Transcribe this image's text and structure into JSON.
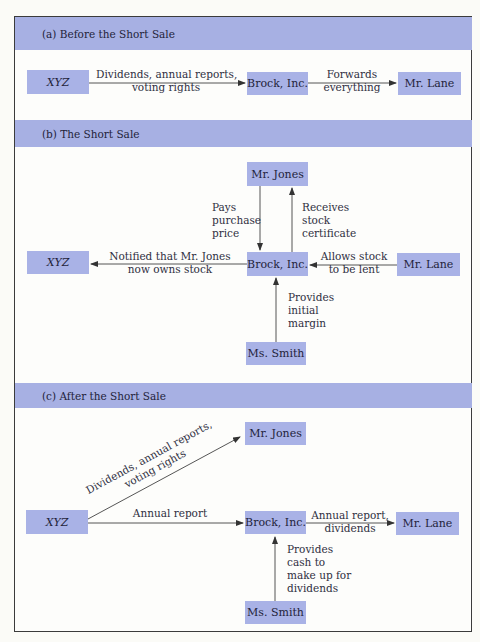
{
  "diagram": {
    "sections": [
      {
        "id": "a",
        "title": "(a) Before the Short Sale",
        "nodes": {
          "xyz": "XYZ",
          "brock": "Brock, Inc.",
          "lane": "Mr. Lane"
        },
        "edges": {
          "xyz_to_brock": {
            "line1": "Dividends, annual reports,",
            "line2": "voting rights"
          },
          "brock_to_lane": {
            "line1": "Forwards",
            "line2": "everything"
          }
        }
      },
      {
        "id": "b",
        "title": "(b) The Short Sale",
        "nodes": {
          "jones": "Mr. Jones",
          "xyz": "XYZ",
          "brock": "Brock, Inc.",
          "lane": "Mr. Lane",
          "smith": "Ms. Smith"
        },
        "edges": {
          "jones_to_brock": {
            "line1": "Pays",
            "line2": "purchase",
            "line3": "price"
          },
          "brock_to_jones": {
            "line1": "Receives",
            "line2": "stock",
            "line3": "certificate"
          },
          "brock_to_xyz": {
            "line1": "Notified that Mr. Jones",
            "line2": "now owns stock"
          },
          "lane_to_brock": {
            "line1": "Allows stock",
            "line2": "to be lent"
          },
          "smith_to_brock": {
            "line1": "Provides",
            "line2": "initial",
            "line3": "margin"
          }
        }
      },
      {
        "id": "c",
        "title": "(c) After the Short Sale",
        "nodes": {
          "jones": "Mr. Jones",
          "xyz": "XYZ",
          "brock": "Brock, Inc.",
          "lane": "Mr. Lane",
          "smith": "Ms. Smith"
        },
        "edges": {
          "xyz_to_jones": {
            "line1": "Dividends, annual reports,",
            "line2": "voting rights"
          },
          "xyz_to_brock": {
            "line1": "Annual report"
          },
          "brock_to_lane": {
            "line1": "Annual report,",
            "line2": "dividends"
          },
          "smith_to_brock": {
            "line1": "Provides",
            "line2": "cash to",
            "line3": "make up for",
            "line4": "dividends"
          }
        }
      }
    ],
    "colors": {
      "band": "#a7b0e3",
      "node": "#a9b2e6",
      "line": "#444444",
      "border": "#3b3b3b"
    }
  }
}
